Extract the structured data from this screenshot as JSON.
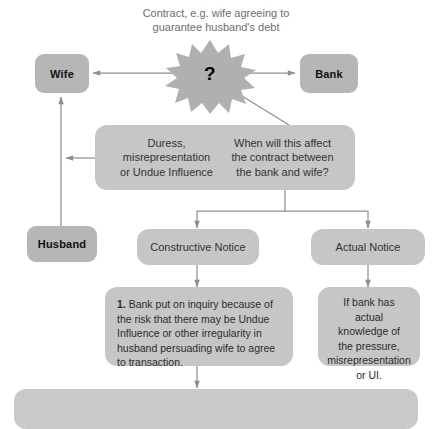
{
  "diagram": {
    "title_lines": [
      "Contract, e.g. wife agreeing to",
      "guarantee husband's debt"
    ],
    "burst_label": "?",
    "entities": {
      "wife": "Wife",
      "bank": "Bank",
      "husband": "Husband"
    },
    "question_box": {
      "left_text_lines": [
        "Duress,",
        "misrepresentation",
        "or Undue Influence"
      ],
      "right_text_lines": [
        "When will this affect",
        "the contract between",
        "the bank and wife?"
      ]
    },
    "branches": {
      "constructive": "Constructive Notice",
      "actual": "Actual Notice"
    },
    "constructive_detail": {
      "number": "1.",
      "body": "Bank put on inquiry because of the risk that there may be Undue Influence or other irregularity in husband persuading wife to agree to transaction."
    },
    "actual_detail_lines": [
      "If bank has",
      "actual",
      "knowledge of",
      "the pressure,",
      "misrepresentation",
      "or UI."
    ],
    "bottom_bar_text": ""
  },
  "colors": {
    "entity_fill": "#b6b6b6",
    "box_fill": "#c6c6c6",
    "connector": "#8f8f8f",
    "title_text": "#6d6d6d",
    "body_text": "#2b2b2b"
  }
}
